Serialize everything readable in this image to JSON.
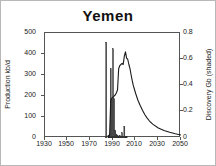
{
  "chart_data": {
    "type": "line",
    "title": "Yemen",
    "xlabel": "",
    "ylabel": "Production kb/d",
    "y2label": "Discovery Gb (shaded)",
    "xlim": [
      1930,
      2050
    ],
    "ylim": [
      0,
      500
    ],
    "y2lim": [
      0,
      0.8
    ],
    "grid": false,
    "legend": "none",
    "xticks": [
      1930,
      1950,
      1970,
      1990,
      2010,
      2030,
      2050
    ],
    "yticks": [
      0,
      100,
      200,
      300,
      400,
      500
    ],
    "y2ticks": [
      0,
      0.2,
      0.4,
      0.6,
      0.8
    ],
    "series": [
      {
        "name": "Discovery Gb (shaded)",
        "axis": "right",
        "type": "bar",
        "x": [
          1984,
          1986,
          1987,
          1988,
          1989,
          1990,
          1991,
          1992,
          1993,
          1994,
          1995,
          1996,
          1997,
          1998,
          1999,
          2000,
          2001,
          2002
        ],
        "values": [
          0.73,
          0.02,
          0.03,
          0.53,
          0.3,
          0.68,
          0.3,
          0.06,
          0.03,
          0.02,
          0.01,
          0.02,
          0.01,
          0.04,
          0.01,
          0.09,
          0.01,
          0.01
        ]
      },
      {
        "name": "Production kb/d",
        "axis": "left",
        "type": "line",
        "x": [
          1986,
          1987,
          1988,
          1989,
          1990,
          1991,
          1992,
          1993,
          1994,
          1995,
          1996,
          1997,
          1998,
          1999,
          2000,
          2001,
          2002,
          2003,
          2004,
          2005,
          2006,
          2007,
          2008,
          2010,
          2012,
          2014,
          2016,
          2018,
          2020,
          2022,
          2025,
          2030,
          2035,
          2040,
          2045,
          2050
        ],
        "values": [
          5,
          15,
          180,
          190,
          195,
          200,
          205,
          215,
          230,
          330,
          345,
          350,
          355,
          350,
          390,
          410,
          380,
          375,
          350,
          330,
          300,
          272,
          248,
          212,
          180,
          155,
          132,
          112,
          96,
          82,
          66,
          48,
          36,
          27,
          20,
          14
        ]
      }
    ]
  }
}
